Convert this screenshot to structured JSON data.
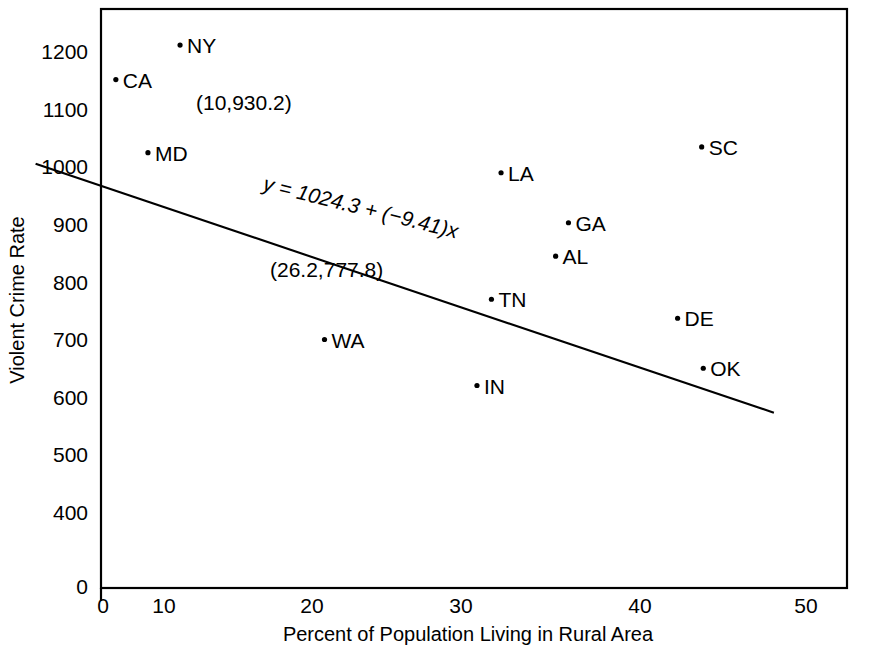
{
  "chart_data": {
    "type": "scatter",
    "title": "",
    "xlabel": "Percent of Population Living in Rural Area",
    "ylabel": "Violent Crime Rate",
    "xlim": [
      0,
      50
    ],
    "ylim": [
      0,
      1250
    ],
    "x_ticks": [
      "0",
      "10",
      "20",
      "30",
      "40",
      "50"
    ],
    "y_ticks": [
      "0",
      "400",
      "500",
      "600",
      "700",
      "800",
      "900",
      "1000",
      "1100",
      "1200"
    ],
    "grid": false,
    "legend": false,
    "axis_break_x": true,
    "axis_break_y": true,
    "points": [
      {
        "label": "NY",
        "x": 11.0,
        "y": 1212
      },
      {
        "label": "CA",
        "x": 7.0,
        "y": 1152
      },
      {
        "label": "MD",
        "x": 9.0,
        "y": 1025
      },
      {
        "label": "SC",
        "x": 43.5,
        "y": 1035
      },
      {
        "label": "LA",
        "x": 31.0,
        "y": 990
      },
      {
        "label": "GA",
        "x": 35.2,
        "y": 903
      },
      {
        "label": "AL",
        "x": 34.4,
        "y": 845
      },
      {
        "label": "TN",
        "x": 30.4,
        "y": 770
      },
      {
        "label": "DE",
        "x": 42.0,
        "y": 737
      },
      {
        "label": "WA",
        "x": 20.0,
        "y": 700
      },
      {
        "label": "OK",
        "x": 43.6,
        "y": 650
      },
      {
        "label": "IN",
        "x": 29.5,
        "y": 620
      }
    ],
    "annotations": [
      {
        "name": "point-annotation-ny",
        "text": "(10,930.2)"
      },
      {
        "name": "point-annotation-mean",
        "text": "(26.2,777.8)"
      }
    ],
    "regression": {
      "equation_text": "y = 1024.3 + (−9.41)x",
      "intercept": 1024.3,
      "slope": -9.41,
      "x_start": 2.0,
      "x_end": 48.0
    },
    "colors": {
      "line": "#000000",
      "marker": "#000000",
      "background": "#ffffff"
    }
  }
}
